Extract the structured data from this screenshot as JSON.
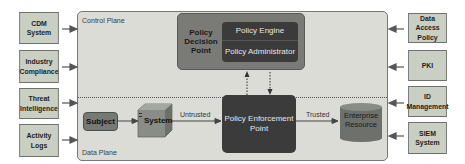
{
  "diagram": {
    "left_inputs": [
      {
        "label_line1": "CDM",
        "label_line2": "System"
      },
      {
        "label_line1": "Industry",
        "label_line2": "Compliance"
      },
      {
        "label_line1": "Threat",
        "label_line2": "Intelligence"
      },
      {
        "label_line1": "Activity",
        "label_line2": "Logs"
      }
    ],
    "right_inputs": [
      {
        "label_line1": "Data Access",
        "label_line2": "Policy"
      },
      {
        "label_line1": "PKI",
        "label_line2": ""
      },
      {
        "label_line1": "ID",
        "label_line2": "Management"
      },
      {
        "label_line1": "SIEM",
        "label_line2": "System"
      }
    ],
    "control_plane_label": "Control Plane",
    "data_plane_label": "Data Plane",
    "pdp": {
      "label_line1": "Policy",
      "label_line2": "Decision",
      "label_line3": "Point",
      "engine": "Policy Engine",
      "administrator": "Policy Administrator"
    },
    "subject": "Subject",
    "system": "System",
    "pep": {
      "label_line1": "Policy Enforcement",
      "label_line2": "Point"
    },
    "resource": {
      "label_line1": "Enterprise",
      "label_line2": "Resource"
    },
    "edges": {
      "untrusted": "Untrusted",
      "trusted": "Trusted"
    },
    "colors": {
      "side_box": "#c9cfc3",
      "plane_bg": "#dcdcd6",
      "pdp_bg": "#7a7a76",
      "dark_box": "#3b3b3b",
      "resource": "#6e706b"
    }
  }
}
